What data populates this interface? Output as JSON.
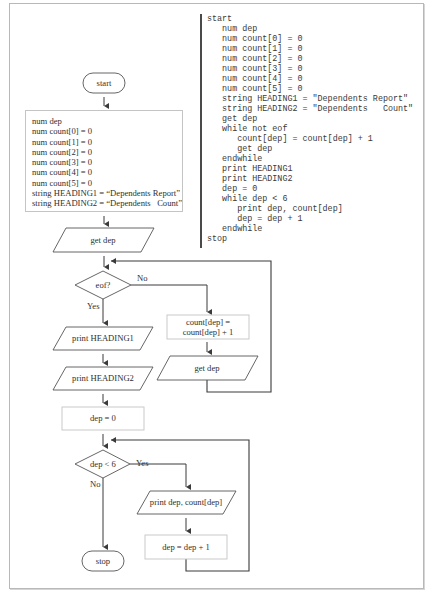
{
  "pseudocode": {
    "lines": [
      {
        "indent": 0,
        "text": "start"
      },
      {
        "indent": 1,
        "text": "num dep"
      },
      {
        "indent": 1,
        "text": "num count[0] = 0"
      },
      {
        "indent": 1,
        "text": "num count[1] = 0"
      },
      {
        "indent": 1,
        "text": "num count[2] = 0"
      },
      {
        "indent": 1,
        "text": "num count[3] = 0"
      },
      {
        "indent": 1,
        "text": "num count[4] = 0"
      },
      {
        "indent": 1,
        "text": "num count[5] = 0"
      },
      {
        "indent": 1,
        "text": "string HEADING1 = \"Dependents Report\""
      },
      {
        "indent": 1,
        "text": "string HEADING2 = \"Dependents   Count\""
      },
      {
        "indent": 1,
        "text": "get dep"
      },
      {
        "indent": 1,
        "text": "while not eof"
      },
      {
        "indent": 2,
        "text": "count[dep] = count[dep] + 1"
      },
      {
        "indent": 2,
        "text": "get dep"
      },
      {
        "indent": 1,
        "text": "endwhile"
      },
      {
        "indent": 1,
        "text": "print HEADING1"
      },
      {
        "indent": 1,
        "text": "print HEADING2"
      },
      {
        "indent": 1,
        "text": "dep = 0"
      },
      {
        "indent": 1,
        "text": "while dep < 6"
      },
      {
        "indent": 2,
        "text": "print dep, count[dep]"
      },
      {
        "indent": 2,
        "text": "dep = dep + 1"
      },
      {
        "indent": 1,
        "text": "endwhile"
      },
      {
        "indent": 0,
        "text": "stop"
      }
    ]
  },
  "flowchart": {
    "start": "start",
    "declarations": [
      "num dep",
      "num count[0] = 0",
      "num count[1] = 0",
      "num count[2] = 0",
      "num count[3] = 0",
      "num count[4] = 0",
      "num count[5] = 0",
      "string HEADING1 = “Dependents Report”",
      "string HEADING2 = “Dependents   Count”"
    ],
    "get_dep_1": "get dep",
    "decision_eof": "eof?",
    "eof_no_label": "No",
    "eof_yes_label": "Yes",
    "count_increment_line1": "count[dep] =",
    "count_increment_line2": "count[dep] + 1",
    "get_dep_2": "get dep",
    "print_heading1": "print HEADING1",
    "print_heading2": "print HEADING2",
    "dep_zero": "dep = 0",
    "decision_dep": "dep < 6",
    "dep_yes_label": "Yes",
    "dep_no_label": "No",
    "print_dep": "print dep, count[dep]",
    "dep_increment": "dep = dep + 1",
    "stop": "stop"
  }
}
